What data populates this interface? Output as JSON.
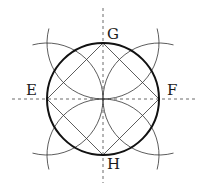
{
  "diagram": {
    "type": "geometric construction",
    "labels": {
      "top": "G",
      "bottom": "H",
      "left": "E",
      "right": "F"
    },
    "colors": {
      "main_circle": "#111111",
      "construction_lines": "#333333",
      "axes": "#444444",
      "background": "#ffffff"
    },
    "elements": [
      "dashed vertical axis through G and H",
      "dashed horizontal axis through E and F",
      "bold main circle",
      "inscribed square E-G-F-H",
      "four arcs centered at E, F, G, H passing through center"
    ]
  }
}
